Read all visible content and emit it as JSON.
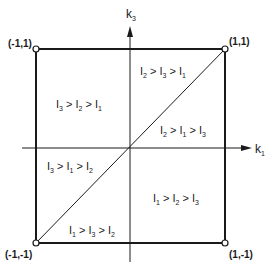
{
  "axes": {
    "horizontal_label": "k",
    "horizontal_sub": "1",
    "vertical_label": "k",
    "vertical_sub": "3"
  },
  "corners": {
    "top_left": "(-1,1)",
    "top_right": "(1,1)",
    "bottom_left": "(-1,-1)",
    "bottom_right": "(1,-1)"
  },
  "regions": [
    {
      "id": "upper-left",
      "parts": [
        "I",
        "3",
        " > I",
        "2",
        " > I",
        "1"
      ]
    },
    {
      "id": "upper-right-top",
      "parts": [
        "I",
        "2",
        " > I",
        "3",
        " > I",
        "1"
      ]
    },
    {
      "id": "upper-right-bottom",
      "parts": [
        "I",
        "2",
        " > I",
        "1",
        " > I",
        "3"
      ]
    },
    {
      "id": "lower-left-top",
      "parts": [
        "I",
        "3",
        " > I",
        "1",
        " > I",
        "2"
      ]
    },
    {
      "id": "lower-left-bottom",
      "parts": [
        "I",
        "1",
        " > I",
        "3",
        " > I",
        "2"
      ]
    },
    {
      "id": "lower-right",
      "parts": [
        "I",
        "1",
        " > I",
        "2",
        " > I",
        "3"
      ]
    }
  ],
  "colors": {
    "stroke": "#1a1a1a",
    "background": "#ffffff"
  }
}
